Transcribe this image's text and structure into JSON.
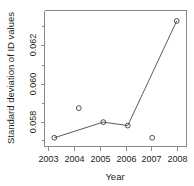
{
  "chart_data": {
    "type": "line",
    "title": "",
    "xlabel": "Year",
    "ylabel": "Standard deviation of ID values",
    "x": [
      2003,
      2004,
      2005,
      2006,
      2007,
      2008
    ],
    "categories": [
      "2003",
      "2004",
      "2005",
      "2006",
      "2007",
      "2008"
    ],
    "values": [
      0.0572,
      0.0589,
      0.0581,
      0.0579,
      0.0572,
      0.0639
    ],
    "series": [
      {
        "name": "Standard deviation of ID values",
        "x": [
          2003,
          2004,
          2005,
          2006,
          2007,
          2008
        ],
        "values": [
          0.0572,
          0.0589,
          0.0581,
          0.0579,
          0.0572,
          0.0639
        ]
      }
    ],
    "connected_points": {
      "x": [
        2003,
        2005,
        2006,
        2008
      ],
      "values": [
        0.0572,
        0.0581,
        0.0579,
        0.0639
      ]
    },
    "unconnected_points": {
      "x": [
        2004,
        2007
      ],
      "values": [
        0.0589,
        0.0572
      ]
    },
    "xlim": [
      2002.6,
      2008.4
    ],
    "ylim": [
      0.0567,
      0.0645
    ],
    "yticks": [
      0.058,
      0.06,
      0.062
    ],
    "ytick_labels": [
      "0.058",
      "0.060",
      "0.062"
    ],
    "xticks": [
      2003,
      2004,
      2005,
      2006,
      2007,
      2008
    ],
    "xtick_labels": [
      "2003",
      "2004",
      "2005",
      "2006",
      "2007",
      "2008"
    ],
    "grid": false,
    "legend": null,
    "marker": "open-circle",
    "line_color": "#4a4a4a",
    "marker_color": "#3c3c3c",
    "axis_color": "#8a8a8a",
    "text_color": "#231f20",
    "background": "#ffffff"
  },
  "axis": {
    "x_title": "Year",
    "y_title": "Standard deviation of ID values",
    "y_labels": {
      "t0": "0.058",
      "t1": "0.060",
      "t2": "0.062"
    },
    "x_labels": {
      "t0": "2003",
      "t1": "2004",
      "t2": "2005",
      "t3": "2006",
      "t4": "2007",
      "t5": "2008"
    }
  }
}
